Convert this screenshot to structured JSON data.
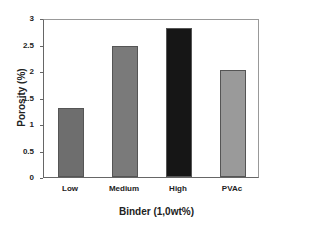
{
  "chart_data": {
    "type": "bar",
    "title": "",
    "xlabel": "Binder (1,0wt%)",
    "ylabel": "Porosity (%)",
    "categories": [
      "Low",
      "Medium",
      "High",
      "PVAc"
    ],
    "values": [
      1.32,
      2.5,
      2.85,
      2.04
    ],
    "bar_colors": [
      "#6e6e6e",
      "#7a7a7a",
      "#161616",
      "#9a9a9a"
    ],
    "ylim": [
      0,
      3
    ],
    "yticks": [
      "0",
      "0.5",
      "1",
      "1.5",
      "2",
      "2.5",
      "3"
    ],
    "grid": false,
    "legend": null
  }
}
